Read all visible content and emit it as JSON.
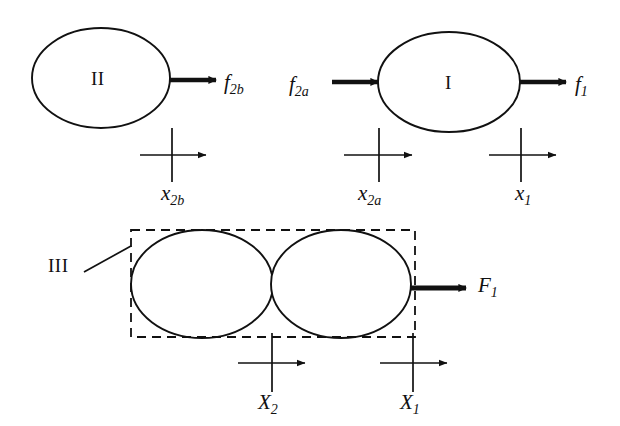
{
  "figure": {
    "background_color": "#ffffff",
    "stroke_color": "#111111",
    "width": 620,
    "height": 426
  },
  "bodies": [
    {
      "id": "body-II",
      "label": "II",
      "label_style": "roman",
      "row": "top",
      "cx": 101,
      "cy": 78,
      "rx": 69,
      "ry": 50
    },
    {
      "id": "body-I",
      "label": "I",
      "label_style": "roman",
      "row": "top",
      "cx": 449,
      "cy": 82,
      "rx": 71,
      "ry": 50
    },
    {
      "id": "body-III-left",
      "label": "",
      "label_style": "roman",
      "row": "bottom",
      "cx": 202,
      "cy": 284,
      "rx": 71,
      "ry": 54
    },
    {
      "id": "body-III-right",
      "label": "",
      "label_style": "roman",
      "row": "bottom",
      "cx": 341,
      "cy": 284,
      "rx": 70,
      "ry": 54
    }
  ],
  "group_box": {
    "id": "box-III",
    "label": "III",
    "label_style": "roman",
    "style": "dashed",
    "x": 131,
    "y": 230,
    "width": 284,
    "height": 107
  },
  "force_arrows": [
    {
      "id": "arrow-f2b",
      "label": "f",
      "subscript": "2b",
      "direction": "right",
      "x1": 170,
      "x2": 216,
      "y": 80,
      "label_x": 224,
      "label_y": 82
    },
    {
      "id": "arrow-f2a",
      "label": "f",
      "subscript": "2a",
      "direction": "right",
      "x1": 332,
      "x2": 378,
      "y": 82,
      "label_x": 289,
      "label_y": 84
    },
    {
      "id": "arrow-f1",
      "label": "f",
      "subscript": "1",
      "direction": "right",
      "x1": 519,
      "x2": 566,
      "y": 82,
      "label_x": 575,
      "label_y": 84
    },
    {
      "id": "arrow-F1",
      "label": "F",
      "subscript": "1",
      "direction": "right",
      "x1": 410,
      "x2": 466,
      "y": 288,
      "label_x": 478,
      "label_y": 285
    }
  ],
  "coordinate_markers": [
    {
      "id": "marker-x2b",
      "label": "x",
      "subscript": "2b",
      "cross_x": 172,
      "cross_y": 155,
      "tick_top": 128,
      "tick_bottom": 182,
      "arrow_x1": 140,
      "arrow_x2": 206,
      "label_x": 161,
      "label_y": 190
    },
    {
      "id": "marker-x2a",
      "label": "x",
      "subscript": "2a",
      "cross_x": 379,
      "cross_y": 155,
      "tick_top": 128,
      "tick_bottom": 182,
      "arrow_x1": 344,
      "arrow_x2": 412,
      "label_x": 358,
      "label_y": 190
    },
    {
      "id": "marker-x1",
      "label": "x",
      "subscript": "1",
      "cross_x": 521,
      "cross_y": 155,
      "tick_top": 128,
      "tick_bottom": 182,
      "arrow_x1": 489,
      "arrow_x2": 556,
      "label_x": 515,
      "label_y": 190
    },
    {
      "id": "marker-X2",
      "label": "X",
      "subscript": "2",
      "cross_x": 272,
      "cross_y": 363,
      "tick_top": 333,
      "tick_bottom": 392,
      "arrow_x1": 238,
      "arrow_x2": 305,
      "label_x": 258,
      "label_y": 399
    },
    {
      "id": "marker-X1",
      "label": "X",
      "subscript": "1",
      "cross_x": 413,
      "cross_y": 363,
      "tick_top": 333,
      "tick_bottom": 392,
      "arrow_x1": 380,
      "arrow_x2": 447,
      "label_x": 400,
      "label_y": 399
    }
  ],
  "leader_line": {
    "id": "leader-III",
    "x1": 84,
    "y1": 272,
    "x2": 131,
    "y2": 246
  },
  "group_label_position": {
    "x": 48,
    "y": 256
  }
}
